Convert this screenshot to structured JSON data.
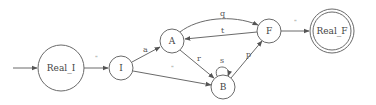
{
  "diagram": {
    "type": "finite-state-automaton",
    "colors": {
      "stroke": "#6a6a6a",
      "text": "#444444",
      "background": "#ffffff"
    },
    "start_state": "Real_I",
    "accept_states": [
      "Real_F"
    ],
    "nodes": [
      {
        "id": "Real_I",
        "label": "Real_I",
        "cx": 61,
        "cy": 68,
        "r": 23,
        "accepting": false
      },
      {
        "id": "I",
        "label": "I",
        "cx": 121,
        "cy": 68,
        "r": 12,
        "accepting": false
      },
      {
        "id": "A",
        "label": "A",
        "cx": 172,
        "cy": 41,
        "r": 12,
        "accepting": false
      },
      {
        "id": "B",
        "label": "B",
        "cx": 223,
        "cy": 87,
        "r": 12,
        "accepting": false
      },
      {
        "id": "F",
        "label": "F",
        "cx": 269,
        "cy": 31,
        "r": 12,
        "accepting": false
      },
      {
        "id": "Real_F",
        "label": "Real_F",
        "cx": 332,
        "cy": 31,
        "r": 22,
        "accepting": true
      }
    ],
    "edges": [
      {
        "from": "Real_I",
        "to": "I",
        "label": "\""
      },
      {
        "from": "I",
        "to": "A",
        "label": "a"
      },
      {
        "from": "I",
        "to": "B",
        "label": "\""
      },
      {
        "from": "A",
        "to": "F",
        "label": "q"
      },
      {
        "from": "F",
        "to": "A",
        "label": "t"
      },
      {
        "from": "A",
        "to": "B",
        "label": "r"
      },
      {
        "from": "B",
        "to": "B",
        "label": "s"
      },
      {
        "from": "B",
        "to": "F",
        "label": "p"
      },
      {
        "from": "F",
        "to": "Real_F",
        "label": "\""
      }
    ]
  },
  "labels": {
    "nodes": {
      "real_i": "Real_I",
      "i": "I",
      "a": "A",
      "b": "B",
      "f": "F",
      "real_f": "Real_F"
    },
    "edges": {
      "real_i_to_i": "\"",
      "i_to_a": "a",
      "i_to_b": "\"",
      "a_to_f": "q",
      "f_to_a": "t",
      "a_to_b": "r",
      "b_to_b": "s",
      "b_to_f": "p",
      "f_to_real_f": "\""
    }
  }
}
